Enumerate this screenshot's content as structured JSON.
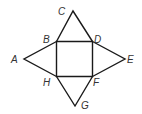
{
  "diagram": {
    "type": "net of square pyramid",
    "stroke_color": "#1a1a1a",
    "points": {
      "A": [
        24,
        59
      ],
      "B": [
        56.5,
        41.5
      ],
      "C": [
        73,
        11
      ],
      "D": [
        92.5,
        41.5
      ],
      "E": [
        125,
        59
      ],
      "F": [
        92.5,
        76.5
      ],
      "G": [
        75,
        106
      ],
      "H": [
        56.5,
        76.5
      ]
    },
    "labels": {
      "A": "A",
      "B": "B",
      "C": "C",
      "D": "D",
      "E": "E",
      "F": "F",
      "G": "G",
      "H": "H"
    }
  }
}
